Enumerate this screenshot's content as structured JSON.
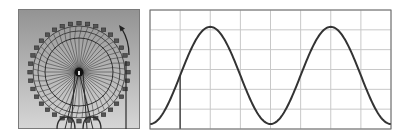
{
  "figure": {
    "left_image": {
      "subject": "ferris-wheel-photo",
      "rotation_arrow": "counterclockwise",
      "colors": {
        "sky_top": "#939393",
        "sky_bottom": "#d6d6d6",
        "structure": "#2e2e2e"
      }
    },
    "right_chart": {
      "colors": {
        "grid": "#c8c8c8",
        "border": "#6a6a6a",
        "curve": "#333333",
        "marker_line": "#333333",
        "background": "#ffffff"
      }
    }
  },
  "chart_data": {
    "type": "line",
    "title": "",
    "xlabel": "",
    "ylabel": "",
    "grid": true,
    "legend": "none",
    "x_gridlines": [
      0,
      1,
      2,
      3,
      4,
      5,
      6,
      7,
      8
    ],
    "y_gridlines": [
      0,
      1,
      2,
      3,
      4,
      5,
      6
    ],
    "xlim": [
      0,
      8
    ],
    "ylim": [
      0,
      6
    ],
    "series": [
      {
        "name": "height",
        "x": [
          0,
          0.5,
          1,
          1.5,
          2,
          2.5,
          3,
          3.5,
          4,
          4.5,
          5,
          5.5,
          6,
          6.5,
          7,
          7.5,
          8
        ],
        "values": [
          0.25,
          0.97,
          2.7,
          4.43,
          5.15,
          4.43,
          2.7,
          0.97,
          0.25,
          0.97,
          2.7,
          4.43,
          5.15,
          4.43,
          2.7,
          0.97,
          0.25
        ]
      }
    ],
    "annotations": [
      {
        "type": "vertical-line",
        "x": 1,
        "from_y": 0,
        "to_y": 2.7
      }
    ]
  }
}
